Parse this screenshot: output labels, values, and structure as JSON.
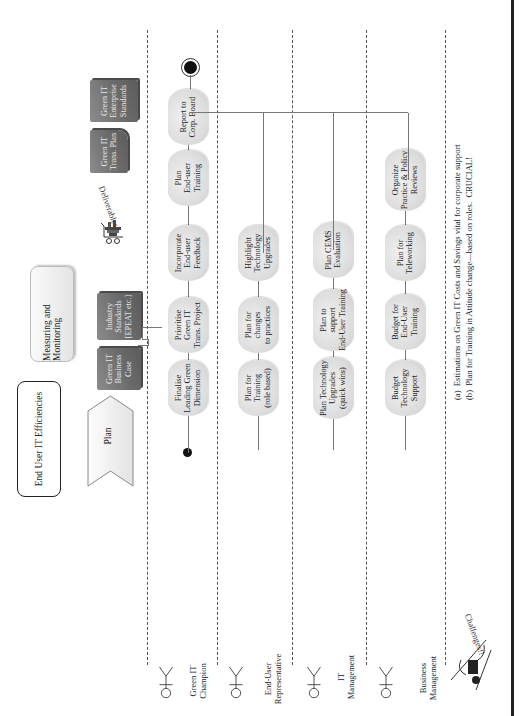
{
  "title_box": "End User  IT Efficiencies",
  "phase_label": "Plan",
  "monitoring_label": "Measuring and Monitoring",
  "deliverables_label": "Deliverables",
  "documents": {
    "business_case": "Green IT\nBusiness\nCase",
    "industry_standards": "Industry\nStandards\n[EPEAT etc.]",
    "trans_plan": "Green IT\nTrans. Plan",
    "enterprise_standards": "Green IT\nEnterprise\nStandards"
  },
  "lanes": [
    {
      "actor": "Green IT\nChampion",
      "activities": [
        "Finalise\nLeading Green\nDimension",
        "Prioritise\nGreen IT\nTrans. Project",
        "Incorporate\nEnd-user\nFeedback",
        "Plan\nEnd-user\nTraining",
        "Report to\nCorp. Board"
      ]
    },
    {
      "actor": "End-User\nRepresentative",
      "activities": [
        "Plan for\nTraining\n(role based)",
        "Plan for\nchanges\nto practices",
        "Highlight\nTechnology\nUpgrades"
      ]
    },
    {
      "actor": "IT\nManagement",
      "activities": [
        "Plan Technology\nUpgrades\n(quick wins)",
        "Plan to\nsupport\nEnd-User Training",
        "Plan CEMS\nEvaluation"
      ]
    },
    {
      "actor": "Business\nManagement",
      "activities": [
        "Budget\nTechnology\nSupport",
        "Budget for\nEnd-User\nTraining",
        "Plan for\nTeleworking",
        "Organize\nPractice & Policy\nReviews"
      ]
    }
  ],
  "challenges_label": "Challenges!!",
  "footnotes": [
    "(a)  Estimations on Green IT Costs and Savings vital for corporate support",
    "(b)  Plan for Training in Attitude change—based on roles.  CRUCIAL!"
  ],
  "colors": {
    "node_fill": "#dcdcdc",
    "doc_fill": "#6a6a6a",
    "lane_divider": "#555555",
    "connector": "#777777"
  }
}
